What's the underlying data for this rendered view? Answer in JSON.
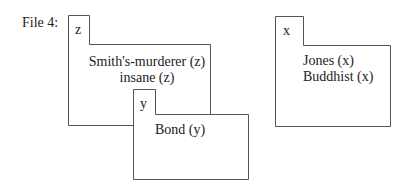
{
  "file_label": "File 4:",
  "files": [
    {
      "id": "z",
      "tab_label": "z",
      "entries": [
        "Smith's-murderer (z)",
        "insane (z)"
      ]
    },
    {
      "id": "y",
      "tab_label": "y",
      "entries": [
        "Bond (y)"
      ]
    },
    {
      "id": "x",
      "tab_label": "x",
      "entries": [
        "Jones (x)",
        "Buddhist (x)"
      ]
    }
  ],
  "colors": {
    "stroke": "#555555",
    "text": "#222222",
    "background": "#ffffff"
  }
}
